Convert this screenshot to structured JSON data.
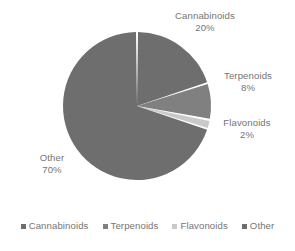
{
  "chart_data": {
    "type": "pie",
    "title": "",
    "categories": [
      "Cannabinoids",
      "Terpenoids",
      "Flavonoids",
      "Other"
    ],
    "values": [
      20,
      8,
      2,
      70
    ],
    "value_unit": "%",
    "data_labels": [
      {
        "name": "Cannabinoids",
        "value": "20%"
      },
      {
        "name": "Terpenoids",
        "value": "8%"
      },
      {
        "name": "Flavonoids",
        "value": "2%"
      },
      {
        "name": "Other",
        "value": "70%"
      }
    ],
    "colors": [
      "#6e6e6e",
      "#808080",
      "#c9c9c9",
      "#6e6e6e"
    ],
    "slice_gap_color": "#ffffff",
    "start_angle_deg": 0,
    "legend_position": "bottom",
    "legend": [
      {
        "label": "Cannabinoids",
        "color": "#6e6e6e"
      },
      {
        "label": "Terpenoids",
        "color": "#808080"
      },
      {
        "label": "Flavonoids",
        "color": "#c9c9c9"
      },
      {
        "label": "Other",
        "color": "#6e6e6e"
      }
    ],
    "geometry": {
      "center_x": 137,
      "center_y": 106,
      "radius": 74
    }
  }
}
